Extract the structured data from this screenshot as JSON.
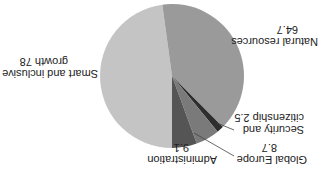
{
  "chart_data": {
    "type": "pie",
    "title": "",
    "orientation_note_rotated_180": true,
    "slices": [
      {
        "label": "Smart and inclusive growth",
        "value": 78,
        "color": "#c4c4c4"
      },
      {
        "label": "Natural resources",
        "value": 64.7,
        "color": "#9a9a9a"
      },
      {
        "label": "Security and citizenship",
        "value": 2.5,
        "color": "#2e2e2e"
      },
      {
        "label": "Global Europe",
        "value": 8.7,
        "color": "#7a7a7a"
      },
      {
        "label": "Administration",
        "value": 9.1,
        "color": "#555555"
      }
    ]
  },
  "labels": {
    "smart": {
      "line1": "Smart and inclusive",
      "line2": "growth 78"
    },
    "natural": {
      "line1": "Natural resources",
      "line2": "64.7"
    },
    "security": {
      "line1": "Security and",
      "line2": "citizenship 2.5"
    },
    "global": {
      "line1": "Global Europe",
      "line2": "8.7"
    },
    "admin": {
      "line1": "Administration",
      "line2": "9.1"
    }
  }
}
